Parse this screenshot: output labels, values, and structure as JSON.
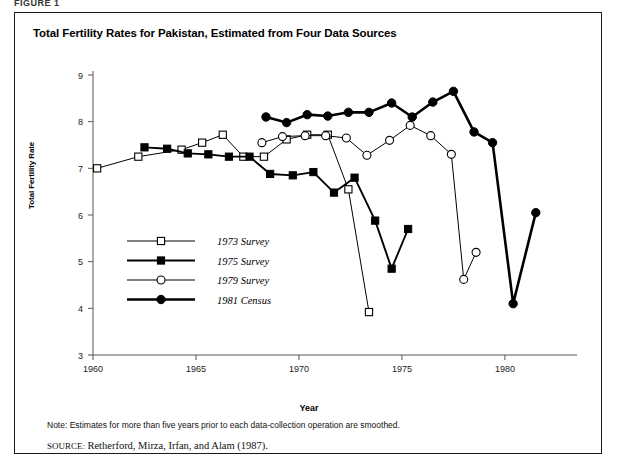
{
  "figure": {
    "tag": "FIGURE 1",
    "title": "Total Fertility Rates for Pakistan, Estimated from Four Data Sources"
  },
  "notes": {
    "note": "Note: Estimates for more than five years prior to each data-collection operation are smoothed.",
    "source_label": "SOURCE:",
    "source_text": "Retherford, Mirza, Irfan, and Alam (1987)."
  },
  "chart_data": {
    "type": "line",
    "title": "Total Fertility Rates for Pakistan, Estimated from Four Data Sources",
    "xlabel": "Year",
    "ylabel": "Total Fertility Rate",
    "xlim": [
      1960,
      1983.5
    ],
    "ylim": [
      3,
      9
    ],
    "xticks": [
      1960,
      1965,
      1970,
      1975,
      1980
    ],
    "yticks": [
      3,
      4,
      5,
      6,
      7,
      8,
      9
    ],
    "grid": false,
    "legend_position": "lower-left-inside",
    "series": [
      {
        "name": "1973 Survey",
        "marker": "open-square",
        "line_width": 1,
        "color": "#000000",
        "points": [
          [
            1960.2,
            7.0
          ],
          [
            1962.2,
            7.25
          ],
          [
            1964.3,
            7.4
          ],
          [
            1965.3,
            7.55
          ],
          [
            1966.3,
            7.72
          ],
          [
            1967.3,
            7.25
          ],
          [
            1968.3,
            7.25
          ],
          [
            1969.4,
            7.62
          ],
          [
            1970.4,
            7.72
          ],
          [
            1971.4,
            7.72
          ],
          [
            1972.4,
            6.55
          ],
          [
            1973.4,
            3.92
          ]
        ]
      },
      {
        "name": "1975 Survey",
        "marker": "filled-square",
        "line_width": 1.9,
        "color": "#000000",
        "points": [
          [
            1962.5,
            7.45
          ],
          [
            1963.6,
            7.42
          ],
          [
            1964.6,
            7.32
          ],
          [
            1965.6,
            7.3
          ],
          [
            1966.6,
            7.25
          ],
          [
            1967.6,
            7.25
          ],
          [
            1968.6,
            6.88
          ],
          [
            1969.7,
            6.85
          ],
          [
            1970.7,
            6.92
          ],
          [
            1971.7,
            6.48
          ],
          [
            1972.7,
            6.8
          ],
          [
            1973.7,
            5.88
          ],
          [
            1974.5,
            4.85
          ],
          [
            1975.3,
            5.7
          ]
        ]
      },
      {
        "name": "1979 Survey",
        "marker": "open-circle",
        "line_width": 1,
        "color": "#000000",
        "points": [
          [
            1968.2,
            7.55
          ],
          [
            1969.2,
            7.68
          ],
          [
            1970.3,
            7.7
          ],
          [
            1971.3,
            7.7
          ],
          [
            1972.3,
            7.65
          ],
          [
            1973.3,
            7.28
          ],
          [
            1974.4,
            7.6
          ],
          [
            1975.4,
            7.92
          ],
          [
            1976.4,
            7.7
          ],
          [
            1977.4,
            7.3
          ],
          [
            1978.0,
            4.62
          ],
          [
            1978.6,
            5.2
          ]
        ]
      },
      {
        "name": "1981 Census",
        "marker": "filled-circle",
        "line_width": 2.6,
        "color": "#000000",
        "points": [
          [
            1968.4,
            8.1
          ],
          [
            1969.4,
            7.98
          ],
          [
            1970.4,
            8.15
          ],
          [
            1971.4,
            8.12
          ],
          [
            1972.4,
            8.2
          ],
          [
            1973.4,
            8.2
          ],
          [
            1974.5,
            8.4
          ],
          [
            1975.5,
            8.1
          ],
          [
            1976.5,
            8.42
          ],
          [
            1977.5,
            8.65
          ],
          [
            1978.5,
            7.78
          ],
          [
            1979.4,
            7.55
          ],
          [
            1980.4,
            4.1
          ],
          [
            1981.5,
            6.05
          ]
        ]
      }
    ],
    "legend": [
      {
        "label": "1973 Survey",
        "marker": "open-square",
        "line_width": 1
      },
      {
        "label": "1975 Survey",
        "marker": "filled-square",
        "line_width": 1.9
      },
      {
        "label": "1979 Survey",
        "marker": "open-circle",
        "line_width": 1
      },
      {
        "label": "1981 Census",
        "marker": "filled-circle",
        "line_width": 2.6
      }
    ]
  }
}
